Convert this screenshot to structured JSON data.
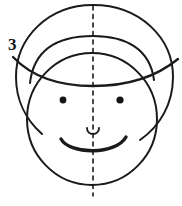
{
  "figure": {
    "background_color": "#ffffff",
    "ink_color": "#1a1a1a",
    "width": 182,
    "height": 206,
    "labels": [
      {
        "id": "label-3",
        "text": "3",
        "x": 8,
        "y": 36,
        "font_size": 17
      }
    ],
    "parts": {
      "head_circle": {
        "name": "head-outline",
        "shape": "circle",
        "cx": 92,
        "cy": 97,
        "r": 88,
        "stroke_width": 2.0
      },
      "face_oval": {
        "name": "face-oval",
        "shape": "ellipse",
        "cx": 92,
        "cy": 120,
        "rx": 65,
        "ry": 65,
        "stroke_width": 2.0
      },
      "cap_crown": {
        "name": "cap-crown-arc",
        "shape": "arc",
        "stroke_width": 2.0
      },
      "cap_brim": {
        "name": "cap-brim-arc",
        "shape": "arc",
        "left_end_x": 13,
        "left_end_y": 57,
        "right_end_x": 178,
        "right_end_y": 59,
        "stroke_width": 2.2
      },
      "eye_left": {
        "name": "eye-left",
        "shape": "dot",
        "cx": 63,
        "cy": 100,
        "r": 3.4
      },
      "eye_right": {
        "name": "eye-right",
        "shape": "dot",
        "cx": 120,
        "cy": 100,
        "r": 3.6
      },
      "nose": {
        "name": "nose",
        "shape": "small-u-arc",
        "cx": 93,
        "cy": 132,
        "stroke_width": 1.8
      },
      "mouth": {
        "name": "mouth-smile",
        "shape": "arc",
        "left_x": 62,
        "right_x": 126,
        "bottom_y": 152,
        "stroke_width": 3.2
      },
      "symmetry_axis": {
        "name": "symmetry-axis",
        "shape": "dashed-vertical-line",
        "x": 93,
        "y_top": 6,
        "y_bottom": 196,
        "dash_pattern": "4 4.5",
        "stroke_width": 1.6
      }
    }
  }
}
